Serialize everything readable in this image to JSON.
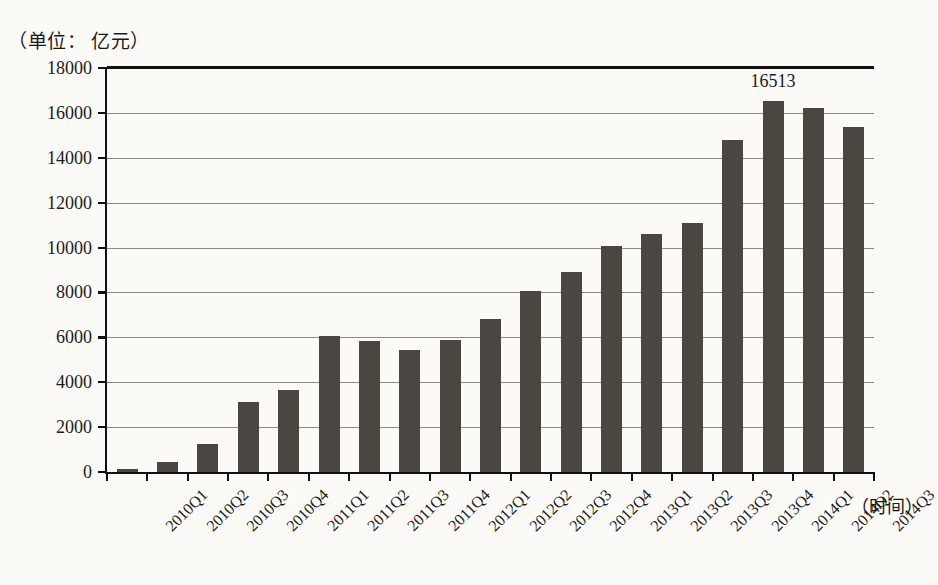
{
  "unit_caption": "（单位： 亿元）",
  "x_axis_title": "（时间）",
  "chart_data": {
    "type": "bar",
    "title": "",
    "subtitle": "",
    "unit_note": "（单位： 亿元）",
    "xlabel": "（时间）",
    "ylabel": "",
    "ylim": [
      0,
      18000
    ],
    "ytick_step": 2000,
    "yticks": [
      0,
      2000,
      4000,
      6000,
      8000,
      10000,
      12000,
      14000,
      16000,
      18000
    ],
    "ytick_labels": [
      "0",
      "2000",
      "4000",
      "6000",
      "8000",
      "10000",
      "12000",
      "14000",
      "16000",
      "18000"
    ],
    "grid": true,
    "grid_axis": "y",
    "legend": null,
    "legend_position": "none",
    "bar_color": "#4a4741",
    "background_color": "#fbfaf7",
    "axis_color": "#111111",
    "gridline_color": "#8c8c86",
    "categories": [
      "2010Q1",
      "2010Q2",
      "2010Q3",
      "2010Q4",
      "2011Q1",
      "2011Q2",
      "2011Q3",
      "2011Q4",
      "2012Q1",
      "2012Q2",
      "2012Q3",
      "2012Q4",
      "2013Q1",
      "2013Q2",
      "2013Q3",
      "2013Q4",
      "2014Q1",
      "2014Q2",
      "2014Q3"
    ],
    "values": [
      130,
      430,
      1270,
      3100,
      3650,
      6050,
      5850,
      5450,
      5870,
      6800,
      8050,
      8900,
      10050,
      10600,
      11100,
      14800,
      16513,
      16200,
      15350
    ],
    "annotations": [
      {
        "category": "2014Q1",
        "value": 16513,
        "text": "16513"
      }
    ]
  }
}
